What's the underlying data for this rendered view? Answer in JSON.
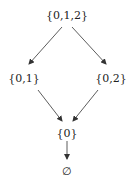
{
  "diagram": {
    "type": "hasse-diagram",
    "nodes": [
      {
        "id": "top",
        "label": "{0,1,2}",
        "x": 67,
        "y": 15
      },
      {
        "id": "left",
        "label": "{0,1}",
        "x": 24,
        "y": 78
      },
      {
        "id": "right",
        "label": "{0,2}",
        "x": 111,
        "y": 78
      },
      {
        "id": "mid",
        "label": "{0}",
        "x": 67,
        "y": 133
      },
      {
        "id": "bottom",
        "label": "∅",
        "x": 67,
        "y": 171
      }
    ],
    "edges": [
      {
        "from": "top",
        "to": "left",
        "arrow": true
      },
      {
        "from": "top",
        "to": "right",
        "arrow": true
      },
      {
        "from": "left",
        "to": "mid",
        "arrow": true
      },
      {
        "from": "right",
        "to": "mid",
        "arrow": true
      },
      {
        "from": "mid",
        "to": "bottom",
        "arrow": true
      }
    ],
    "colors": {
      "line": "#333333",
      "text": "#222222",
      "background": "#ffffff"
    }
  }
}
